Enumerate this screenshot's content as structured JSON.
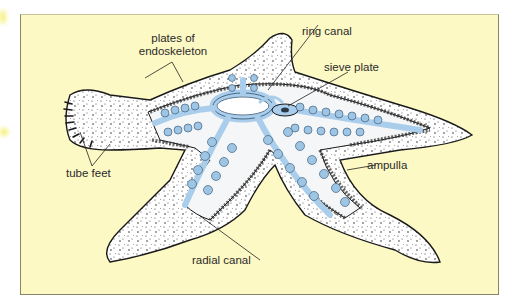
{
  "figure": {
    "background_color": "#fdf9c4",
    "canal_color": "#a9cdea",
    "body_color": "#ffffff",
    "outline_color": "#222222"
  },
  "labels": {
    "plates_of_endoskeleton": {
      "line1": "plates of",
      "line2": "endoskeleton"
    },
    "ring_canal": "ring canal",
    "sieve_plate": "sieve plate",
    "tube_feet": "tube feet",
    "ampulla": "ampulla",
    "radial_canal": "radial canal"
  }
}
